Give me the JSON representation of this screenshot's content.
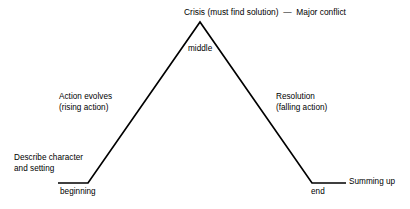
{
  "diagram": {
    "background_color": "#ffffff",
    "line_color": "#000000",
    "text_color": "#000000",
    "labels": {
      "crisis": "Crisis (must find solution)  —  Major conflict",
      "middle": "middle",
      "rising": "Action evolves\n(rising action)",
      "falling": "Resolution\n(falling action)",
      "describe": "Describe character\nand setting",
      "beginning": "beginning",
      "end": "end",
      "summing_up": "Summing up"
    },
    "shape": {
      "type": "polyline",
      "points": [
        {
          "x": 58,
          "y": 183
        },
        {
          "x": 88,
          "y": 183
        },
        {
          "x": 200,
          "y": 22
        },
        {
          "x": 312,
          "y": 183
        },
        {
          "x": 346,
          "y": 183
        }
      ],
      "stroke_width": 1.7
    }
  }
}
